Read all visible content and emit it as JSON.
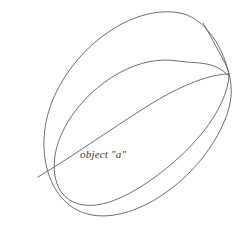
{
  "figure": {
    "kind": "line-drawing",
    "background_color": "#ffffff",
    "stroke_color": "#6e6e6e",
    "stroke_width": 1,
    "label": {
      "text": "object \"a\"",
      "style": "italic",
      "color": "#3a3a3a",
      "x": 80,
      "y": 148
    },
    "parts": [
      {
        "name": "outer-ellipse",
        "description": "large tilted outer ellipse forming the far rim of the band",
        "path": "M 229 74 C 233 88 232 104 224 122 C 214 146 194 172 168 191 C 142 210 114 219 92 215 C 70 211 55 195 48 172 C 41 149 43 122 54 97 C 65 72 85 47 110 31 C 134 15 159 9 180 13 C 201 17 221 40 229 74 Z"
      },
      {
        "name": "inner-ellipse",
        "description": "inner tilted ellipse forming the near rim / hole of the band",
        "path": "M 229 76 C 228 92 219 112 203 132 C 186 153 164 172 142 186 C 120 200 100 207 84 205 C 68 203 58 193 55 176 C 52 159 57 139 69 120 C 81 101 99 84 119 73 C 139 62 159 58 178 61 C 197 64 213 60 229 76 Z"
      },
      {
        "name": "top-right-edge",
        "description": "short near-straight band thickness edge at the top right corner",
        "path": "M 203 23 C 209 33 218 50 225 63 C 227 68 229 72 229 75"
      },
      {
        "name": "diagonal-chord",
        "description": "long diagonal inner edge running from lower-left rim to the top-right junction",
        "path": "M 38 177 C 70 158 108 131 146 107 C 184 83 212 74 229 74"
      }
    ]
  }
}
